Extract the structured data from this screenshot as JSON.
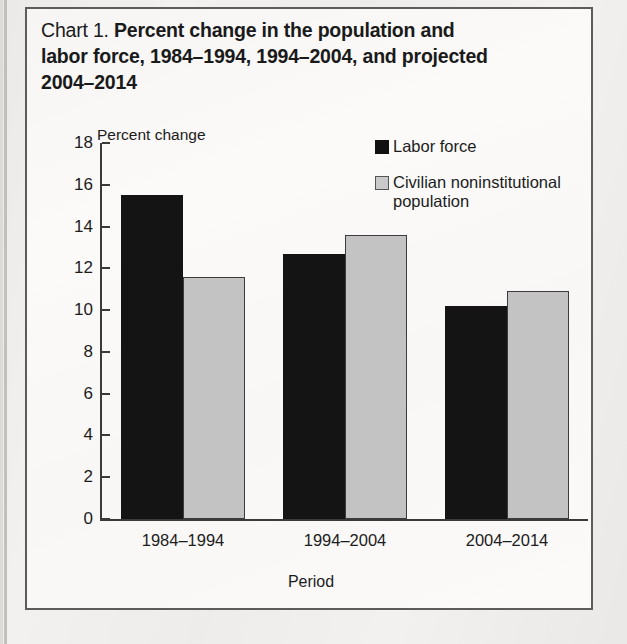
{
  "figure": {
    "label": "Chart 1.",
    "title_lines": [
      "Percent change in the population and",
      "labor force, 1984–1994, 1994–2004, and projected",
      "2004–2014"
    ]
  },
  "colors": {
    "labor_force": "#141414",
    "population": "#c3c3c3",
    "axis": "#3a3a3a",
    "border": "#5d5c5a",
    "text": "#1c1c1c",
    "page_background": "#f2f1ef",
    "chart_background": "#fbfaf9"
  },
  "chart_data": {
    "type": "bar",
    "title": "Chart 1. Percent change in the population and labor force, 1984–1994, 1994–2004, and projected 2004–2014",
    "xlabel": "Period",
    "ylabel": "Percent change",
    "ylim": [
      0,
      18
    ],
    "yticks": [
      0,
      2,
      4,
      6,
      8,
      10,
      12,
      14,
      16,
      18
    ],
    "ytick_labels": [
      "0",
      "2",
      "4",
      "6",
      "8",
      "10",
      "12",
      "14",
      "16",
      "18"
    ],
    "grid": false,
    "legend_position": "upper right",
    "categories": [
      "1984–1994",
      "1994–2004",
      "2004–2014"
    ],
    "series": [
      {
        "name": "Labor force",
        "color": "#141414",
        "values": [
          15.5,
          12.7,
          10.2
        ]
      },
      {
        "name": "Civilian noninstitutional population",
        "color": "#c3c3c3",
        "values": [
          11.6,
          13.6,
          10.9
        ]
      }
    ]
  }
}
